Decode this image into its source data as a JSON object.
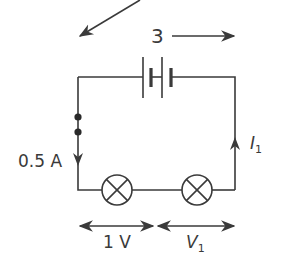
{
  "diagram": {
    "type": "circuit",
    "colors": {
      "line": "#3a3a3a",
      "background": "#ffffff"
    },
    "labels": {
      "battery_voltage": "3",
      "current_left": "0.5 A",
      "current_right_symbol": "I",
      "current_right_sub": "1",
      "lamp1_voltage": "1 V",
      "lamp2_voltage_symbol": "V",
      "lamp2_voltage_sub": "1"
    },
    "components": [
      {
        "id": "battery",
        "kind": "battery",
        "cells": 2
      },
      {
        "id": "lamp-1",
        "kind": "lamp"
      },
      {
        "id": "lamp-2",
        "kind": "lamp"
      },
      {
        "id": "meter-terminals",
        "kind": "junction-dots",
        "count": 2
      }
    ]
  }
}
